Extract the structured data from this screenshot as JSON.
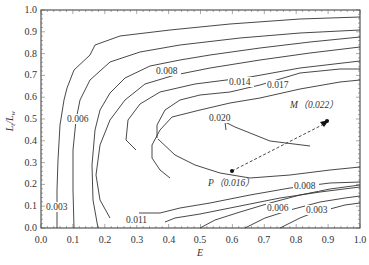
{
  "chart_data": {
    "type": "contour",
    "title": "",
    "xlabel": "E",
    "ylabel": "L_t/L_w",
    "xlim": [
      0.0,
      1.0
    ],
    "ylim": [
      0.0,
      1.0
    ],
    "x_ticks": [
      "0.0",
      "0.1",
      "0.2",
      "0.3",
      "0.4",
      "0.5",
      "0.6",
      "0.7",
      "0.8",
      "0.9",
      "1.0"
    ],
    "y_ticks": [
      "0.0",
      "0.1",
      "0.2",
      "0.3",
      "0.4",
      "0.5",
      "0.6",
      "0.7",
      "0.8",
      "0.9",
      "1.0"
    ],
    "grid": false,
    "contour_levels": [
      0.003,
      0.006,
      0.008,
      0.011,
      0.014,
      0.017,
      0.02
    ],
    "contour_labels": [
      {
        "text": "0.003",
        "x": 0.03,
        "y": 0.11
      },
      {
        "text": "0.006",
        "x": 0.09,
        "y": 0.48
      },
      {
        "text": "0.008",
        "x": 0.33,
        "y": 0.69
      },
      {
        "text": "0.014",
        "x": 0.62,
        "y": 0.64
      },
      {
        "text": "0.017",
        "x": 0.75,
        "y": 0.61
      },
      {
        "text": "0.020",
        "x": 0.53,
        "y": 0.52
      },
      {
        "text": "0.011",
        "x": 0.25,
        "y": 0.04
      },
      {
        "text": "0.008",
        "x": 0.81,
        "y": 0.16
      },
      {
        "text": "0.006",
        "x": 0.68,
        "y": 0.09
      },
      {
        "text": "0.003",
        "x": 0.84,
        "y": 0.09
      }
    ],
    "points": [
      {
        "name": "P",
        "label": "P（0.016）",
        "x": 0.6,
        "y": 0.26,
        "value": 0.016
      },
      {
        "name": "M",
        "label": "M（0.022）",
        "x": 0.9,
        "y": 0.49,
        "value": 0.022
      }
    ],
    "annotations": [
      {
        "type": "dashed-arrow",
        "from": "P",
        "to": "M"
      }
    ]
  },
  "axes": {
    "xlabel": "E",
    "ylabel_main": "L",
    "ylabel_sub1": "t",
    "ylabel_div": "/L",
    "ylabel_sub2": "w"
  },
  "labels": {
    "c003a": "0.003",
    "c006a": "0.006",
    "c008a": "0.008",
    "c014": "0.014",
    "c017": "0.017",
    "c020": "0.020",
    "c011": "0.011",
    "c008b": "0.008",
    "c006b": "0.006",
    "c003b": "0.003",
    "P": "P（0.016）",
    "M": "M（0.022）"
  },
  "ticks": {
    "x": [
      "0.0",
      "0.1",
      "0.2",
      "0.3",
      "0.4",
      "0.5",
      "0.6",
      "0.7",
      "0.8",
      "0.9",
      "1.0"
    ],
    "y": [
      "0.0",
      "0.1",
      "0.2",
      "0.3",
      "0.4",
      "0.5",
      "0.6",
      "0.7",
      "0.8",
      "0.9",
      "1.0"
    ]
  }
}
